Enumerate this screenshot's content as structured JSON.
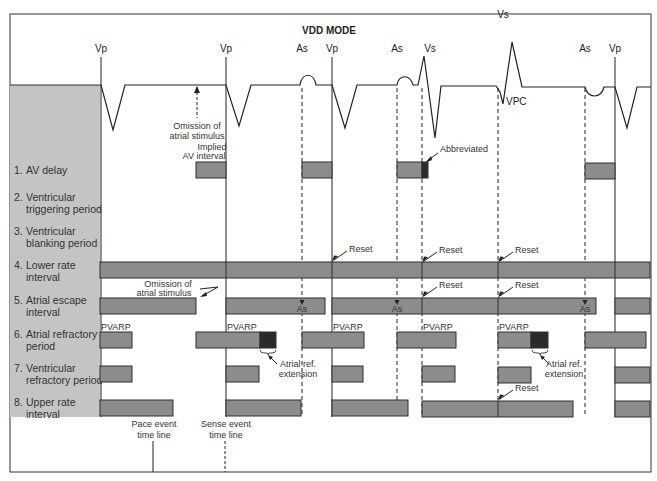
{
  "title": "VDD MODE",
  "colors": {
    "background": "#ffffff",
    "frame": "#333333",
    "label_panel": "#c4c4c4",
    "bar_fill": "#8c8c8c",
    "bar_stroke": "#2e2e2e",
    "extension_fill": "#2b2b2b",
    "line": "#222222"
  },
  "events": [
    {
      "label": "Vp",
      "x": 101,
      "type": "pace"
    },
    {
      "label": "Vp",
      "x": 226,
      "type": "pace"
    },
    {
      "label": "As",
      "x": 302,
      "type": "sense"
    },
    {
      "label": "Vp",
      "x": 332,
      "type": "pace"
    },
    {
      "label": "As",
      "x": 397,
      "type": "sense"
    },
    {
      "label": "Vs",
      "x": 422,
      "type": "sense"
    },
    {
      "label": "Vs",
      "x": 498,
      "type": "sense-vpc"
    },
    {
      "label": "As",
      "x": 585,
      "type": "sense"
    },
    {
      "label": "Vp",
      "x": 615,
      "type": "pace"
    }
  ],
  "ecg_annotations": {
    "vpc_label": "VPC",
    "omission_top": [
      "Omission of",
      "atrial stimulus"
    ],
    "implied_av": [
      "Implied",
      "AV interval"
    ],
    "abbreviated": "Abbreviated"
  },
  "rows": [
    {
      "num": "1.",
      "label": [
        "AV delay"
      ],
      "y": 170
    },
    {
      "num": "2.",
      "label": [
        "Ventricular",
        "triggering period"
      ],
      "y": 203
    },
    {
      "num": "3.",
      "label": [
        "Ventricular",
        "blanking period"
      ],
      "y": 237
    },
    {
      "num": "4.",
      "label": [
        "Lower rate",
        "interval"
      ],
      "y": 271
    },
    {
      "num": "5.",
      "label": [
        "Atrial escape",
        "interval"
      ],
      "y": 306
    },
    {
      "num": "6.",
      "label": [
        "Atrial refractory",
        "period"
      ],
      "y": 340
    },
    {
      "num": "7.",
      "label": [
        "Ventricular",
        "refractory period"
      ],
      "y": 374
    },
    {
      "num": "8.",
      "label": [
        "Upper rate",
        "interval"
      ],
      "y": 408
    }
  ],
  "bars": {
    "av_delay": [
      {
        "x1": 196,
        "x2": 226,
        "y": 162
      },
      {
        "x1": 302,
        "x2": 332,
        "y": 162
      },
      {
        "x1": 397,
        "x2": 422,
        "y": 162,
        "ext_x2": 428
      },
      {
        "x1": 585,
        "x2": 615,
        "y": 163
      }
    ],
    "lower_rate": [
      {
        "x1": 100,
        "x2": 650,
        "y": 262,
        "dividers": [
          226,
          332,
          422,
          498,
          615
        ]
      }
    ],
    "atrial_escape": [
      {
        "x1": 100,
        "x2": 196,
        "y": 298
      },
      {
        "x1": 226,
        "x2": 325,
        "y": 298,
        "as_x": 302
      },
      {
        "x1": 332,
        "x2": 596,
        "y": 298,
        "as_x": [
          397,
          585
        ],
        "dividers": [
          422,
          498
        ]
      },
      {
        "x1": 615,
        "x2": 650,
        "y": 298
      }
    ],
    "atrial_refractory": [
      {
        "x1": 100,
        "x2": 132,
        "y": 332
      },
      {
        "x1": 196,
        "x2": 260,
        "y": 332,
        "ext_x2": 276
      },
      {
        "x1": 302,
        "x2": 364,
        "y": 332
      },
      {
        "x1": 397,
        "x2": 456,
        "y": 332
      },
      {
        "x1": 498,
        "x2": 531,
        "y": 332,
        "ext_x2": 548
      },
      {
        "x1": 585,
        "x2": 646,
        "y": 332
      }
    ],
    "ventricular_refractory": [
      {
        "x1": 100,
        "x2": 132,
        "y": 366
      },
      {
        "x1": 226,
        "x2": 259,
        "y": 366
      },
      {
        "x1": 332,
        "x2": 363,
        "y": 366
      },
      {
        "x1": 422,
        "x2": 455,
        "y": 366
      },
      {
        "x1": 498,
        "x2": 531,
        "y": 367
      },
      {
        "x1": 615,
        "x2": 650,
        "y": 367
      }
    ],
    "upper_rate": [
      {
        "x1": 100,
        "x2": 173,
        "y": 400
      },
      {
        "x1": 226,
        "x2": 301,
        "y": 400
      },
      {
        "x1": 332,
        "x2": 408,
        "y": 400
      },
      {
        "x1": 422,
        "x2": 573,
        "y": 401,
        "dividers": [
          498
        ]
      },
      {
        "x1": 615,
        "x2": 650,
        "y": 401
      }
    ]
  },
  "annotations": {
    "pvarp": "PVARP",
    "pvarp_positions": [
      101,
      227,
      333,
      423,
      499
    ],
    "reset": "Reset",
    "as": "As",
    "omission_row5": [
      "Omission of",
      "atrial stimulus"
    ],
    "atrial_ref_extension": [
      "Atrial ref.",
      "extension"
    ],
    "pace_timeline": [
      "Pace event",
      "time line"
    ],
    "sense_timeline": [
      "Sense event",
      "time line"
    ]
  }
}
